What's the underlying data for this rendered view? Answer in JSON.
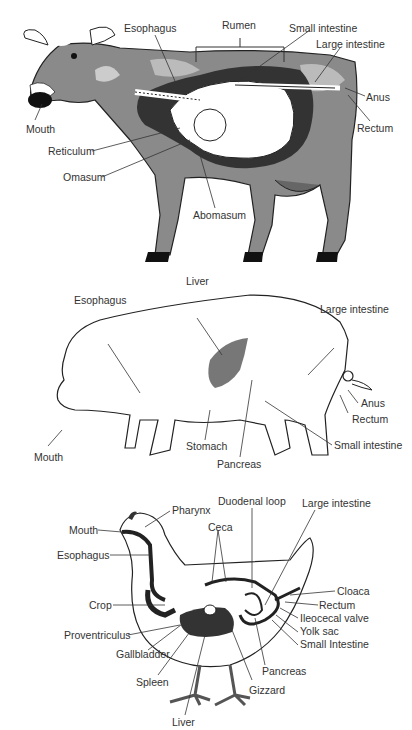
{
  "diagrams": {
    "cow": {
      "labels": {
        "esophagus": "Esophagus",
        "rumen": "Rumen",
        "small_intestine": "Small intestine",
        "large_intestine": "Large intestine",
        "anus": "Anus",
        "rectum": "Rectum",
        "mouth": "Mouth",
        "reticulum": "Reticulum",
        "omasum": "Omasum",
        "abomasum": "Abomasum"
      }
    },
    "pig": {
      "labels": {
        "liver": "Liver",
        "esophagus": "Esophagus",
        "large_intestine": "Large intestine",
        "anus": "Anus",
        "rectum": "Rectum",
        "small_intestine": "Small intestine",
        "mouth": "Mouth",
        "stomach": "Stomach",
        "pancreas": "Pancreas"
      }
    },
    "chicken": {
      "labels": {
        "pharynx": "Pharynx",
        "duodenal_loop": "Duodenal loop",
        "large_intestine": "Large intestine",
        "mouth": "Mouth",
        "ceca": "Ceca",
        "esophagus": "Esophagus",
        "cloaca": "Cloaca",
        "crop": "Crop",
        "rectum": "Rectum",
        "ileocecal_valve": "Ileocecal valve",
        "proventriculus": "Proventriculus",
        "yolk_sac": "Yolk sac",
        "small_intestine": "Small Intestine",
        "gallbladder": "Gallbladder",
        "pancreas": "Pancreas",
        "spleen": "Spleen",
        "gizzard": "Gizzard",
        "liver": "Liver"
      }
    }
  }
}
